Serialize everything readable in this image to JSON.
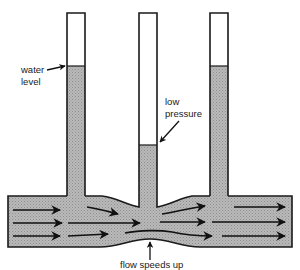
{
  "diagram": {
    "labels": {
      "water_level_line1": "water",
      "water_level_line2": "level",
      "low_pressure_line1": "low",
      "low_pressure_line2": "pressure",
      "flow_speeds_up": "flow speeds up"
    },
    "tubes": [
      {
        "name": "left",
        "x": 67,
        "width": 18,
        "top": 13,
        "water_level": 66
      },
      {
        "name": "middle",
        "x": 139,
        "width": 18,
        "top": 13,
        "water_level": 145
      },
      {
        "name": "right",
        "x": 210,
        "width": 18,
        "top": 13,
        "water_level": 66
      }
    ],
    "colors": {
      "water": "#b4b4b4",
      "outline": "#1a1a1a",
      "arrow": "#111111",
      "background": "#ffffff"
    }
  }
}
